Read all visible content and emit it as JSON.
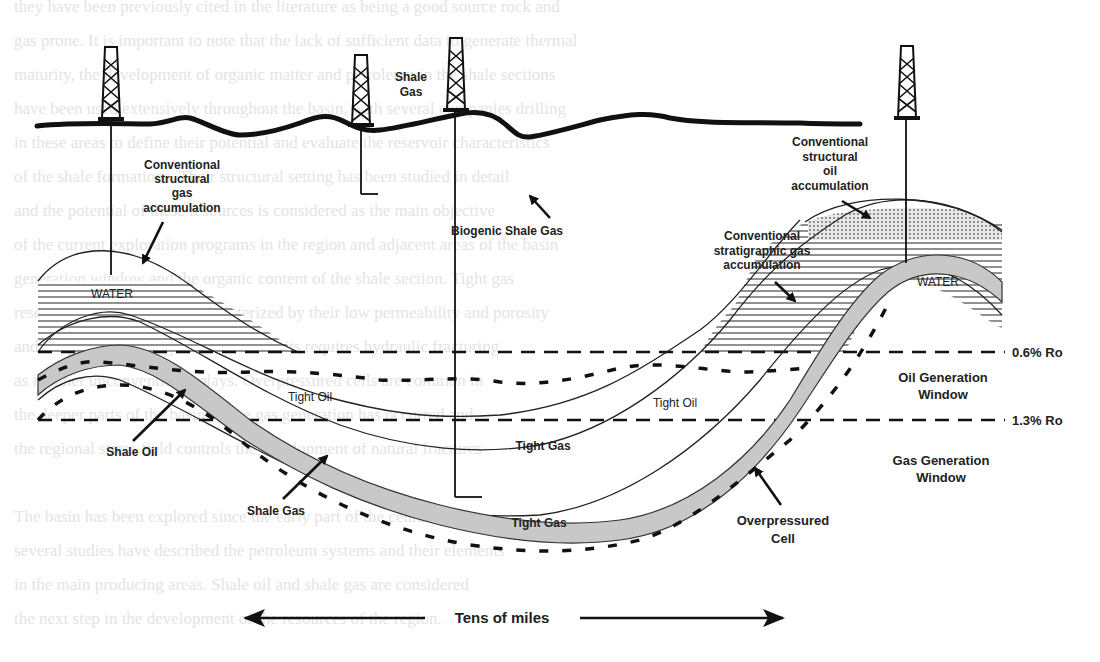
{
  "figure": {
    "surface_labels": {
      "shale_gas_line1": "Shale",
      "shale_gas_line2": "Gas"
    },
    "accumulations": {
      "conv_structural_gas": [
        "Conventional",
        "structural",
        "gas",
        "accumulation"
      ],
      "conv_structural_oil": [
        "Conventional",
        "structural",
        "oil",
        "accumulation"
      ],
      "conv_stratigraphic_gas": [
        "Conventional",
        "stratigraphic gas",
        "accumulation"
      ],
      "biogenic_shale_gas": "Biogenic Shale Gas"
    },
    "fluids": {
      "water_left": "WATER",
      "water_right": "WATER"
    },
    "resource_labels": {
      "tight_oil_left": "Tight Oil",
      "tight_oil_center": "Tight Oil",
      "tight_oil_right": "Tight Oil",
      "tight_gas_upper": "Tight Gas",
      "tight_gas_lower": "Tight Gas",
      "shale_oil": "Shale Oil",
      "shale_gas": "Shale Gas",
      "overpressured_cell": [
        "Overpressured",
        "Cell"
      ]
    },
    "maturity": {
      "ro_upper": "0.6% Ro",
      "ro_lower": "1.3% Ro",
      "oil_window": [
        "Oil Generation",
        "Window"
      ],
      "gas_window": [
        "Gas Generation",
        "Window"
      ]
    },
    "scale": {
      "label": "Tens of miles"
    },
    "colors": {
      "ink": "#111111",
      "shale_fill": "#c8c8c8",
      "bleed_text": "#e4e4e4",
      "background": "#ffffff"
    }
  },
  "bleed_through_text": [
    "they have been previously cited in the literature as being a good source rock and",
    "gas prone. It is important to note that the lack of sufficient data to generate thermal",
    "maturity, the development of organic matter and petroleum in the shale sections",
    "have been used extensively throughout the basin, with several companies drilling",
    "in these areas to define their potential and evaluate the reservoir characteristics",
    "of the shale formations. Their structural setting has been studied in detail",
    "and the potential of these resources is considered as the main objective",
    "of the current exploration programs in the region and adjacent areas of the basin",
    "generation window and the organic content of the shale section. Tight gas",
    "reservoirs in the basin are characterized by their low permeability and porosity",
    "and the production of gas from these units requires hydraulic fracturing",
    "as in other unconventional plays. Overpressured cells are common in",
    "the deeper parts of the basin where gas generation has occurred and",
    "the regional stress field controls the development of natural fractures",
    "The basin has been explored since the early part of the century and",
    "several studies have described the petroleum systems and their elements",
    "in the main producing areas. Shale oil and shale gas are considered",
    "the next step in the development of the resources of the region."
  ]
}
